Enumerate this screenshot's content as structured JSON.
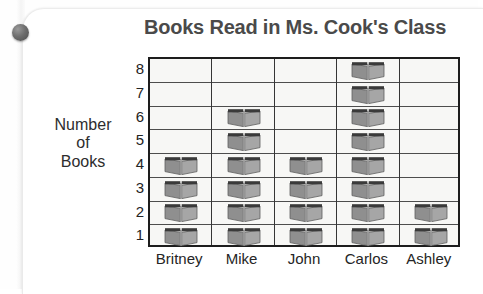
{
  "chart_data": {
    "type": "bar",
    "chart_style": "pictograph",
    "title": "Books Read in Ms. Cook's Class",
    "xlabel": "",
    "ylabel": "Number of Books",
    "ylabel_lines": [
      "Number",
      "of",
      "Books"
    ],
    "categories": [
      "Britney",
      "Mike",
      "John",
      "Carlos",
      "Ashley"
    ],
    "values": [
      4,
      6,
      4,
      8,
      2
    ],
    "series": [
      {
        "name": "Books Read",
        "values": [
          4,
          6,
          4,
          8,
          2
        ]
      }
    ],
    "ylim": [
      0,
      8
    ],
    "y_ticks": [
      8,
      7,
      6,
      5,
      4,
      3,
      2,
      1
    ],
    "grid": true,
    "legend": null,
    "icon_unit": "book-icon",
    "icon_value": 1,
    "annotations": []
  },
  "colors": {
    "page_background": "#ffffff",
    "cell_fill": "#f7f7f5",
    "grid_line": "#4d4d4d",
    "plot_border": "#1d1d1d",
    "title_text": "#4a4a4a",
    "axis_text": "#252525",
    "book_cover": "#8f8f8f",
    "book_page": "#a6a6a6",
    "book_spine": "#3a3a3a",
    "pin": "#5c5c5c"
  },
  "decor": {
    "pin_name": "binder-pin",
    "sheet_name": "scanned-page"
  }
}
